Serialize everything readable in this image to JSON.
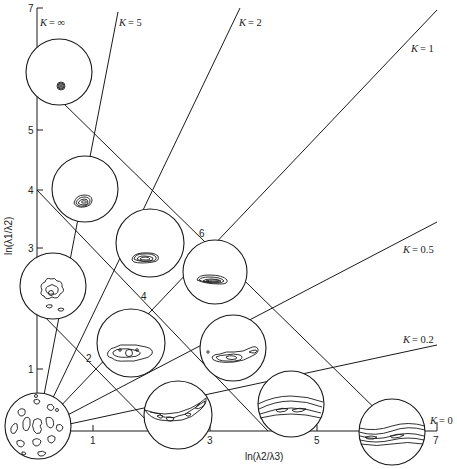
{
  "diagram": {
    "type": "fabric-shape-diagram",
    "x_axis": {
      "label": "ln(λ2/λ3)",
      "ticks": [
        "1",
        "3",
        "5",
        "7"
      ]
    },
    "y_axis": {
      "label": "ln(λ1/λ2)",
      "ticks": [
        "1",
        "3",
        "4",
        "5",
        "7"
      ]
    },
    "k_lines": [
      {
        "id": "k-inf",
        "label": "K = ∞",
        "prefix": "K",
        "value": "= ∞"
      },
      {
        "id": "k-5",
        "label": "K = 5",
        "prefix": "K",
        "value": "= 5"
      },
      {
        "id": "k-2",
        "label": "K = 2",
        "prefix": "K",
        "value": "= 2"
      },
      {
        "id": "k-1",
        "label": "K = 1",
        "prefix": "K",
        "value": "= 1"
      },
      {
        "id": "k-0.5",
        "label": "K = 0.5",
        "prefix": "K",
        "value": "= 0.5"
      },
      {
        "id": "k-0.2",
        "label": "K = 0.2",
        "prefix": "K",
        "value": "= 0.2"
      },
      {
        "id": "k-0",
        "label": "K = 0",
        "prefix": "K",
        "value": "= 0"
      }
    ],
    "strength_lines": [
      {
        "id": "c-2",
        "label": "2"
      },
      {
        "id": "c-4",
        "label": "4"
      },
      {
        "id": "c-6",
        "label": "6"
      }
    ],
    "stereonets": [
      {
        "id": "net-origin",
        "description": "random / uniform fabric"
      },
      {
        "id": "net-cluster-top",
        "description": "strong point cluster"
      },
      {
        "id": "net-cluster-mid",
        "description": "point cluster"
      },
      {
        "id": "net-weak-cluster",
        "description": "weak cluster"
      },
      {
        "id": "net-k2-c4",
        "description": "elongated cluster"
      },
      {
        "id": "net-k1-c6",
        "description": "elongated cluster"
      },
      {
        "id": "net-k1-c4",
        "description": "weak girdle-cluster"
      },
      {
        "id": "net-k05",
        "description": "cluster-girdle"
      },
      {
        "id": "net-girdle-weak",
        "description": "weak girdle"
      },
      {
        "id": "net-girdle-mid",
        "description": "girdle"
      },
      {
        "id": "net-girdle-strong",
        "description": "strong girdle"
      }
    ]
  }
}
